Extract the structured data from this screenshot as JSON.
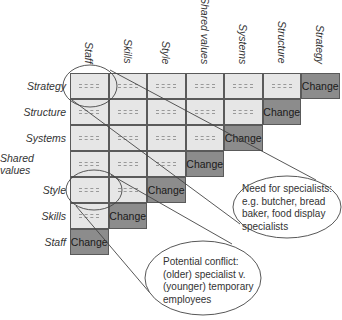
{
  "columns": [
    "Staff",
    "Skills",
    "Style",
    "Shared values",
    "Systems",
    "Structure",
    "Strategy"
  ],
  "rows": [
    "Strategy",
    "Structure",
    "Systems",
    "Shared values",
    "Style",
    "Skills",
    "Staff"
  ],
  "cell_placeholder": "-----",
  "change_label": "Change",
  "callouts": {
    "specialists": {
      "lines": [
        "Need for specialists:",
        "e.g. butcher, bread",
        "baker, food display",
        "specialists"
      ]
    },
    "conflict": {
      "lines": [
        "Potential conflict:",
        "(older) specialist v.",
        "(younger) temporary",
        "employees"
      ]
    }
  },
  "colors": {
    "light_cell": "#e6e6e6",
    "change_cell": "#8c8c8c",
    "border": "#5a5a5a"
  }
}
